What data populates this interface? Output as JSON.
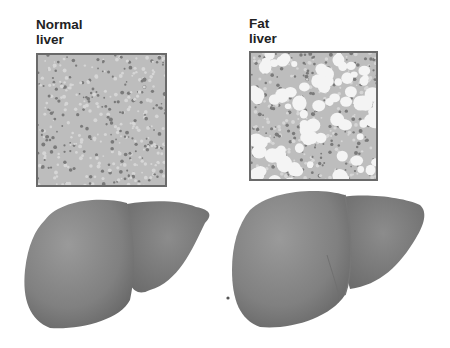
{
  "panels": [
    {
      "id": "normal",
      "label": "Normal\nliver",
      "tissue": "normal",
      "box": {
        "x": 36,
        "y": 53,
        "w": 131,
        "h": 134
      }
    },
    {
      "id": "fat",
      "label": "Fat\nliver",
      "tissue": "fatty",
      "box": {
        "x": 249,
        "y": 51,
        "w": 129,
        "h": 130
      }
    }
  ],
  "colors": {
    "tissue_bg": "#bdbdbd",
    "cell_dot": "#7a7a7a",
    "fat_droplet": "#f4f4f4",
    "liver": "#8a8a8a",
    "liver_dark": "#6e6e6e",
    "border": "#6a6a6a"
  }
}
